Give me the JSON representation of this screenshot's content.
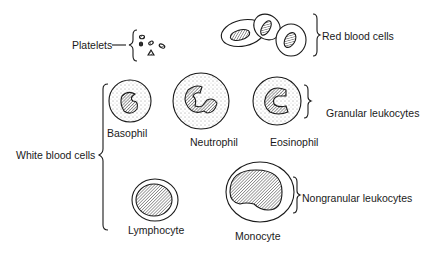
{
  "diagram": {
    "type": "blood-cell-classification",
    "labels": {
      "platelets": "Platelets",
      "red_blood_cells": "Red blood cells",
      "white_blood_cells": "White blood cells",
      "granular_leukocytes": "Granular leukocytes",
      "nongranular_leukocytes": "Nongranular leukocytes",
      "basophil": "Basophil",
      "neutrophil": "Neutrophil",
      "eosinophil": "Eosinophil",
      "lymphocyte": "Lymphocyte",
      "monocyte": "Monocyte"
    },
    "groups": [
      {
        "name": "Platelets",
        "members": []
      },
      {
        "name": "Red blood cells",
        "members": []
      },
      {
        "name": "White blood cells",
        "subgroups": [
          {
            "name": "Granular leukocytes",
            "members": [
              "Basophil",
              "Neutrophil",
              "Eosinophil"
            ]
          },
          {
            "name": "Nongranular leukocytes",
            "members": [
              "Lymphocyte",
              "Monocyte"
            ]
          }
        ]
      }
    ]
  }
}
